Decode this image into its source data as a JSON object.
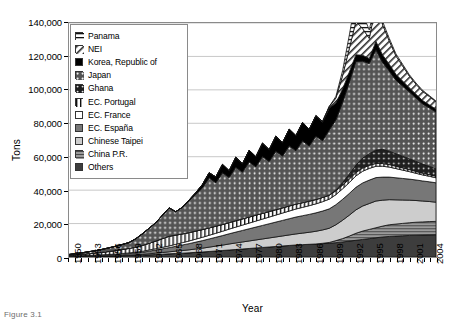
{
  "figure": {
    "caption": "Figure 3.1"
  },
  "legend": {
    "items": [
      {
        "label": "Panama",
        "pattern": "horizontal-lines",
        "color": "#ffffff"
      },
      {
        "label": "NEI",
        "pattern": "diagonal-hatch",
        "color": "#ffffff"
      },
      {
        "label": "Korea, Republic of",
        "pattern": "solid",
        "color": "#000000"
      },
      {
        "label": "Japan",
        "pattern": "dots-dark",
        "color": "#545454"
      },
      {
        "label": "Ghana",
        "pattern": "dots-darker",
        "color": "#1f1f1f"
      },
      {
        "label": "EC. Portugal",
        "pattern": "vertical-lines",
        "color": "#ffffff"
      },
      {
        "label": "EC. France",
        "pattern": "solid",
        "color": "#ffffff"
      },
      {
        "label": "EC. España",
        "pattern": "solid",
        "color": "#777777"
      },
      {
        "label": "Chinese Taipei",
        "pattern": "solid",
        "color": "#cdcdcd"
      },
      {
        "label": "China P.R.",
        "pattern": "fine-lines",
        "color": "#9a9a9a"
      },
      {
        "label": "Others",
        "pattern": "solid",
        "color": "#3d3d3d"
      }
    ]
  },
  "chart_data": {
    "type": "area",
    "title": "",
    "xlabel": "Year",
    "ylabel": "Tons",
    "ylim": [
      0,
      140000
    ],
    "ytick_values": [
      0,
      20000,
      40000,
      60000,
      80000,
      100000,
      120000,
      140000
    ],
    "ytick_labels": [
      "0",
      "20,000",
      "40,000",
      "60,000",
      "80,000",
      "100,000",
      "120,000",
      "140,000"
    ],
    "grid": true,
    "legend_position": "top-left-inside",
    "stacking": "bottom-to-top reversed from legend (Others at bottom, Panama at top)",
    "x": [
      1950,
      1951,
      1952,
      1953,
      1954,
      1955,
      1956,
      1957,
      1958,
      1959,
      1960,
      1961,
      1962,
      1963,
      1964,
      1965,
      1966,
      1967,
      1968,
      1969,
      1970,
      1971,
      1972,
      1973,
      1974,
      1975,
      1976,
      1977,
      1978,
      1979,
      1980,
      1981,
      1982,
      1983,
      1984,
      1985,
      1986,
      1987,
      1988,
      1989,
      1990,
      1991,
      1992,
      1993,
      1994,
      1995,
      1996,
      1997,
      1998,
      1999,
      2000,
      2001,
      2002,
      2003,
      2004,
      2005
    ],
    "xtick_labels": [
      "1950",
      "1953",
      "1956",
      "1959",
      "1962",
      "1965",
      "1968",
      "1971",
      "1974",
      "1977",
      "1980",
      "1983",
      "1986",
      "1989",
      "1992",
      "1995",
      "1998",
      "2001",
      "2004"
    ],
    "xtick_interval": 3,
    "series": [
      {
        "name": "Others",
        "values": [
          300,
          350,
          400,
          450,
          500,
          550,
          600,
          700,
          800,
          900,
          1000,
          1100,
          1300,
          1500,
          1700,
          1900,
          2100,
          2300,
          2500,
          2800,
          3000,
          3300,
          3600,
          3900,
          4200,
          4500,
          4800,
          5100,
          5400,
          5700,
          6000,
          6300,
          6600,
          6900,
          7200,
          7400,
          7600,
          7800,
          8000,
          8200,
          8600,
          9000,
          9500,
          10000,
          10500,
          11000,
          11500,
          12000,
          12300,
          12500,
          12700,
          12900,
          13000,
          13100,
          13200,
          13300
        ]
      },
      {
        "name": "China P.R.",
        "values": [
          0,
          0,
          0,
          0,
          0,
          0,
          0,
          0,
          0,
          0,
          0,
          0,
          0,
          0,
          0,
          0,
          0,
          0,
          0,
          0,
          0,
          0,
          0,
          0,
          0,
          0,
          0,
          0,
          0,
          0,
          0,
          0,
          0,
          0,
          0,
          0,
          0,
          0,
          200,
          500,
          1200,
          2000,
          3000,
          4200,
          5000,
          5500,
          6000,
          6500,
          7000,
          7200,
          7400,
          7600,
          7800,
          7900,
          8000,
          8000
        ]
      },
      {
        "name": "Chinese Taipei",
        "values": [
          0,
          0,
          0,
          0,
          0,
          0,
          0,
          0,
          100,
          200,
          300,
          400,
          600,
          800,
          1000,
          1200,
          1400,
          1600,
          1800,
          2000,
          2300,
          2600,
          2900,
          3200,
          3600,
          3900,
          4200,
          4500,
          4800,
          5100,
          5400,
          5700,
          6000,
          6300,
          6600,
          6900,
          7200,
          7600,
          8000,
          8500,
          9500,
          11000,
          12500,
          14000,
          15000,
          15500,
          16000,
          15500,
          15000,
          14500,
          14000,
          13500,
          13000,
          12500,
          12000,
          11500
        ]
      },
      {
        "name": "EC. España",
        "values": [
          200,
          250,
          300,
          350,
          400,
          500,
          600,
          700,
          800,
          900,
          1100,
          1300,
          1600,
          1900,
          2200,
          2500,
          2900,
          3300,
          3700,
          4100,
          4500,
          4900,
          5300,
          5700,
          6100,
          6500,
          6900,
          7300,
          7700,
          8100,
          8500,
          8900,
          9300,
          9700,
          10100,
          10400,
          10700,
          11000,
          11300,
          11600,
          12000,
          12500,
          13000,
          13500,
          13800,
          14000,
          14000,
          13800,
          13500,
          13200,
          12900,
          12600,
          12300,
          12000,
          11800,
          11600
        ]
      },
      {
        "name": "EC. France",
        "values": [
          100,
          120,
          150,
          180,
          200,
          250,
          300,
          350,
          400,
          450,
          500,
          600,
          700,
          800,
          900,
          1000,
          1200,
          1400,
          1600,
          1800,
          2000,
          2200,
          2400,
          2600,
          2800,
          3000,
          3200,
          3400,
          3600,
          3800,
          4000,
          4200,
          4400,
          4600,
          4800,
          5000,
          5200,
          5400,
          5600,
          5800,
          6000,
          6300,
          6500,
          6800,
          7000,
          7000,
          6800,
          6500,
          6000,
          5500,
          5000,
          4500,
          4000,
          3600,
          3300,
          3000
        ]
      },
      {
        "name": "EC. Portugal",
        "values": [
          400,
          600,
          800,
          1000,
          1200,
          1500,
          1800,
          2100,
          2400,
          2700,
          3000,
          3500,
          4000,
          4500,
          5200,
          5800,
          5500,
          5200,
          5000,
          4800,
          4600,
          4400,
          4200,
          4000,
          3900,
          3800,
          3700,
          3600,
          3500,
          3400,
          3300,
          3200,
          3100,
          3000,
          2900,
          2800,
          2700,
          2600,
          2500,
          2400,
          2300,
          2200,
          2100,
          2000,
          1900,
          1800,
          1700,
          1600,
          1500,
          1400,
          1300,
          1200,
          1100,
          1000,
          950,
          900
        ]
      },
      {
        "name": "Ghana",
        "values": [
          0,
          0,
          0,
          0,
          0,
          0,
          0,
          0,
          0,
          0,
          0,
          0,
          0,
          0,
          0,
          0,
          0,
          0,
          0,
          0,
          0,
          0,
          0,
          0,
          0,
          0,
          0,
          0,
          0,
          0,
          0,
          0,
          0,
          0,
          0,
          0,
          0,
          0,
          0,
          0,
          500,
          1500,
          3000,
          4500,
          6000,
          7000,
          8000,
          8500,
          8000,
          7500,
          7000,
          6500,
          6000,
          5500,
          5000,
          4500
        ]
      },
      {
        "name": "Japan",
        "values": [
          500,
          700,
          900,
          1200,
          1500,
          1800,
          2200,
          2600,
          3000,
          3500,
          5000,
          7000,
          9000,
          11000,
          14000,
          17000,
          14000,
          16000,
          19000,
          22000,
          25000,
          30000,
          26000,
          31000,
          27000,
          32000,
          28000,
          33000,
          29000,
          34000,
          30000,
          35000,
          31000,
          36000,
          32000,
          37000,
          33000,
          38000,
          34000,
          39000,
          42000,
          48000,
          55000,
          62000,
          58000,
          54000,
          60000,
          52000,
          48000,
          44000,
          42000,
          40000,
          38000,
          36000,
          35000,
          34000
        ]
      },
      {
        "name": "Korea, Republic of",
        "values": [
          0,
          0,
          0,
          0,
          0,
          0,
          0,
          0,
          0,
          0,
          0,
          0,
          0,
          0,
          0,
          0,
          0,
          0,
          500,
          1000,
          2000,
          3000,
          3500,
          5000,
          4000,
          6000,
          5000,
          7000,
          6000,
          8000,
          7000,
          9000,
          8000,
          10000,
          9000,
          11000,
          10000,
          12000,
          11000,
          13000,
          10000,
          8000,
          6000,
          4000,
          3500,
          3000,
          5000,
          4500,
          4000,
          3500,
          3000,
          2500,
          2200,
          2000,
          1800,
          1600
        ]
      },
      {
        "name": "NEI",
        "values": [
          0,
          0,
          0,
          0,
          0,
          0,
          0,
          0,
          0,
          0,
          0,
          0,
          0,
          0,
          0,
          0,
          0,
          0,
          0,
          0,
          0,
          0,
          0,
          0,
          0,
          0,
          0,
          0,
          0,
          0,
          0,
          0,
          0,
          0,
          0,
          0,
          0,
          200,
          500,
          1000,
          3000,
          8000,
          14000,
          20000,
          16000,
          12000,
          22000,
          18000,
          14000,
          11000,
          9000,
          7000,
          6000,
          5500,
          5000,
          4500
        ]
      },
      {
        "name": "Panama",
        "values": [
          0,
          0,
          0,
          0,
          0,
          0,
          0,
          0,
          0,
          0,
          0,
          0,
          0,
          0,
          0,
          0,
          0,
          0,
          0,
          0,
          0,
          0,
          0,
          0,
          0,
          0,
          0,
          0,
          0,
          0,
          0,
          0,
          0,
          0,
          0,
          0,
          0,
          0,
          0,
          0,
          1000,
          3000,
          8000,
          14000,
          9000,
          5000,
          3000,
          2000,
          1500,
          1200,
          1000,
          800,
          700,
          600,
          500,
          400
        ]
      }
    ],
    "notes": {
      "peak_year": 1993,
      "peak_total": 133000,
      "secondary_peak_year": 1996,
      "secondary_peak_total": 120000,
      "end_total_2004": 60000
    }
  }
}
